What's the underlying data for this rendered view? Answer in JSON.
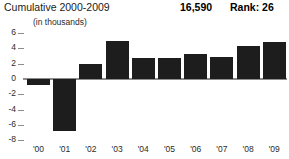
{
  "header": {
    "title": "Cumulative 2000-2009",
    "cumulative_value": "16,590",
    "rank": "Rank: 26"
  },
  "chart_data": {
    "type": "bar",
    "title": "Cumulative 2000-2009",
    "subtitle": "(in thousands)",
    "xlabel": "",
    "ylabel": "",
    "unit": "thousands",
    "categories": [
      "'00",
      "'01",
      "'02",
      "'03",
      "'04",
      "'05",
      "'06",
      "'07",
      "'08",
      "'09"
    ],
    "values": [
      -0.8,
      -6.8,
      2.0,
      5.0,
      2.7,
      2.8,
      3.3,
      2.9,
      4.3,
      4.8
    ],
    "ylim": [
      -8,
      6
    ],
    "yticks": [
      6,
      4,
      2,
      0,
      -2,
      -4,
      -6,
      -8
    ],
    "ytick_labels": [
      "6",
      "4",
      "2",
      "0",
      "-2",
      "-4",
      "-6",
      "-8"
    ],
    "grid": false,
    "legend": null,
    "bar_color": "#1d1d1d",
    "axis_color": "#8c8c8c",
    "cumulative_total": "16,590",
    "rank": 26
  }
}
